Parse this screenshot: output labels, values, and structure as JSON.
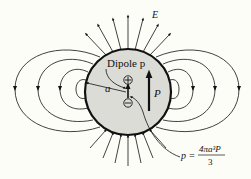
{
  "figure": {
    "colors": {
      "background": "#fdfdf8",
      "sphere_fill": "#dcdcd6",
      "ink": "#111111"
    }
  },
  "labels": {
    "field": "E",
    "dipole": "Dipole p",
    "radius": "a",
    "polarization": "P",
    "plus_charge": "+",
    "minus_charge": "−",
    "equation_lhs": "p =",
    "equation_numerator": "4πa³P",
    "equation_denominator": "3"
  }
}
